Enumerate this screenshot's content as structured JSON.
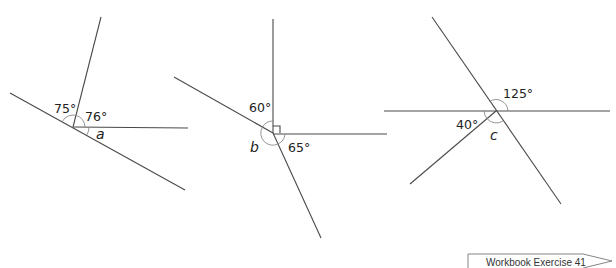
{
  "figures": [
    {
      "id": "a",
      "known_angles": [
        "75°",
        "76°"
      ],
      "unknown_label": "a"
    },
    {
      "id": "b",
      "known_angles": [
        "60°",
        "65°"
      ],
      "right_angle_marker": true,
      "unknown_label": "b"
    },
    {
      "id": "c",
      "known_angles": [
        "125°",
        "40°"
      ],
      "unknown_label": "c"
    }
  ],
  "footer": {
    "reference_label": "Workbook Exercise 41"
  },
  "colors": {
    "line": "#4a4a4a",
    "arc": "#8a8a8a",
    "text": "#222222"
  }
}
